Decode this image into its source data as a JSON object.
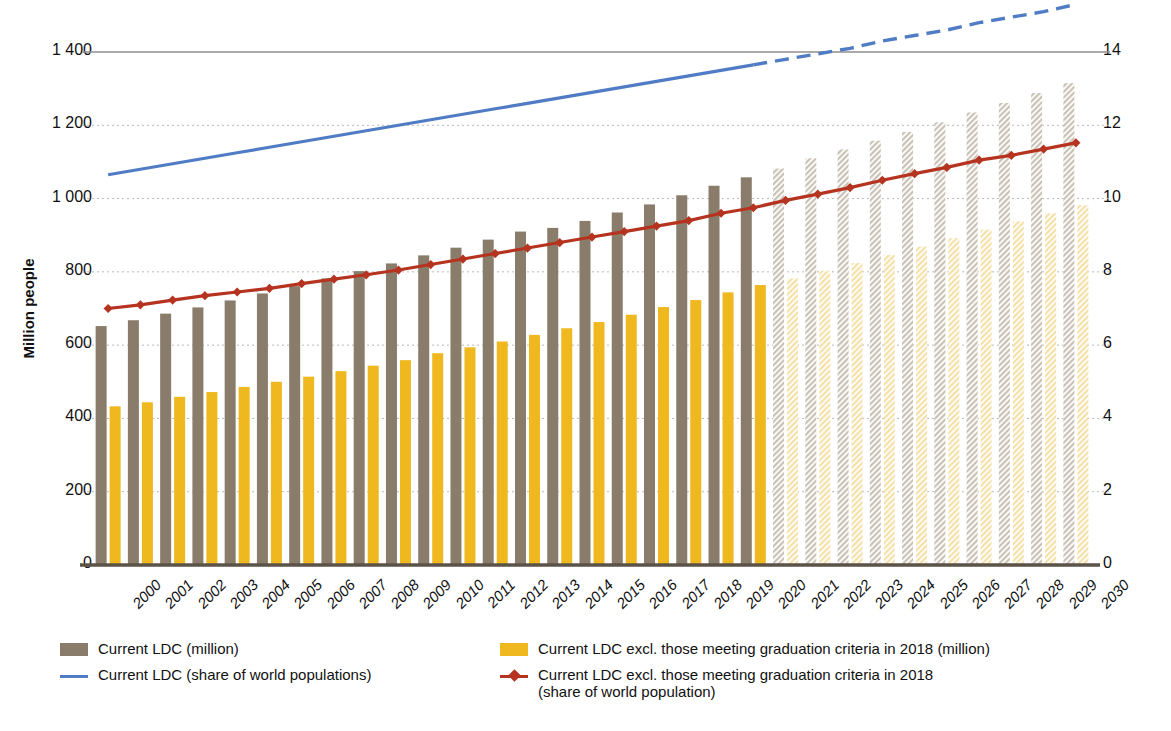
{
  "chart_data": {
    "type": "bar",
    "title": "",
    "subtitle": "",
    "xlabel": "",
    "ylabel": "Million people",
    "ylabel_right": "Percentage share of world total population",
    "ylim": [
      0,
      1400
    ],
    "ylim_right": [
      0,
      14
    ],
    "yticks": [
      "0",
      "200",
      "400",
      "600",
      "800",
      "1 000",
      "1 200",
      "1 400"
    ],
    "ytick_values": [
      0,
      200,
      400,
      600,
      800,
      1000,
      1200,
      1400
    ],
    "yticks_right": [
      "0",
      "2",
      "4",
      "6",
      "8",
      "10",
      "12",
      "14"
    ],
    "ytick_values_right": [
      0,
      2,
      4,
      6,
      8,
      10,
      12,
      14
    ],
    "grid": true,
    "legend_position": "bottom",
    "forecast_start_year": 2021,
    "categories": [
      "2000",
      "2001",
      "2002",
      "2003",
      "2004",
      "2005",
      "2006",
      "2007",
      "2008",
      "2009",
      "2010",
      "2011",
      "2012",
      "2013",
      "2014",
      "2015",
      "2016",
      "2017",
      "2018",
      "2019",
      "2020",
      "2021",
      "2022",
      "2023",
      "2024",
      "2025",
      "2026",
      "2027",
      "2028",
      "2029",
      "2030"
    ],
    "series": [
      {
        "name": "Current LDC (million)",
        "type": "bar",
        "axis": "left",
        "color": "#8a7c6a",
        "values": [
          652,
          668,
          686,
          703,
          722,
          741,
          761,
          782,
          802,
          823,
          845,
          866,
          888,
          910,
          920,
          939,
          962,
          984,
          1009,
          1035,
          1058,
          1082,
          1110,
          1134,
          1158,
          1182,
          1208,
          1235,
          1261,
          1288,
          1315
        ]
      },
      {
        "name": "Current LDC excl. those meeting graduation criteria in 2018 (million)",
        "type": "bar",
        "axis": "left",
        "color": "#efb81e",
        "values": [
          433,
          444,
          459,
          472,
          486,
          500,
          514,
          529,
          544,
          559,
          578,
          594,
          610,
          628,
          646,
          663,
          683,
          704,
          723,
          744,
          764,
          782,
          803,
          824,
          846,
          869,
          892,
          915,
          938,
          960,
          982
        ]
      },
      {
        "name": "Current LDC (share of world populations)",
        "type": "line",
        "axis": "right",
        "color": "#4f7cc4",
        "dashed_from": 2021,
        "values": [
          10.65,
          10.8,
          10.95,
          11.1,
          11.25,
          11.4,
          11.55,
          11.7,
          11.85,
          12.0,
          12.15,
          12.3,
          12.45,
          12.6,
          12.75,
          12.9,
          13.05,
          13.2,
          13.35,
          13.5,
          13.65,
          13.8,
          13.95,
          14.1,
          14.3,
          14.45,
          14.6,
          14.8,
          14.95,
          15.1,
          15.3
        ]
      },
      {
        "name": "Current LDC excl. those meeting graduation criteria in 2018 (share of world population)",
        "type": "line",
        "axis": "right",
        "color": "#b5331f",
        "marker": "diamond",
        "values": [
          7.0,
          7.1,
          7.23,
          7.35,
          7.45,
          7.55,
          7.68,
          7.8,
          7.92,
          8.05,
          8.2,
          8.35,
          8.5,
          8.65,
          8.8,
          8.95,
          9.1,
          9.25,
          9.4,
          9.6,
          9.75,
          9.95,
          10.12,
          10.3,
          10.5,
          10.68,
          10.85,
          11.05,
          11.18,
          11.35,
          11.52
        ]
      }
    ]
  },
  "legend": {
    "items": [
      {
        "label": "Current LDC (million)",
        "kind": "swatch",
        "color": "#8a7c6a",
        "col": 1,
        "row": 1
      },
      {
        "label": "Current LDC (share of world populations)",
        "kind": "line",
        "color": "#4f7cc4",
        "col": 1,
        "row": 2
      },
      {
        "label": "Current LDC excl. those meeting graduation criteria in 2018 (million)",
        "kind": "swatch",
        "color": "#efb81e",
        "col": 2,
        "row": 1
      },
      {
        "label": "Current LDC excl. those meeting graduation criteria in 2018",
        "label2": "(share of world population)",
        "kind": "line-marker",
        "color": "#b5331f",
        "col": 2,
        "row": 2
      }
    ]
  },
  "colors": {
    "bar_gray": "#8a7c6a",
    "bar_yellow": "#efb81e",
    "bar_gray_forecast": "#c9c1b4",
    "bar_yellow_forecast": "#f5e0a6",
    "line_blue": "#4f7cc4",
    "line_red": "#b5331f",
    "grid": "#b9b9b9",
    "axis": "#5b5248"
  }
}
